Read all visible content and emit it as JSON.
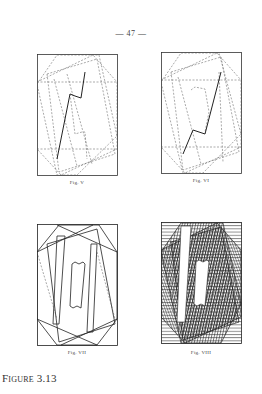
{
  "page": {
    "number": "— 47 —"
  },
  "figures": [
    {
      "id": "fig-v",
      "label": "Fig. V"
    },
    {
      "id": "fig-vi",
      "label": "Fig. VI"
    },
    {
      "id": "fig-vii",
      "label": "Fig. VII"
    },
    {
      "id": "fig-viii",
      "label": "Fig. VIII"
    }
  ],
  "caption": {
    "text": "Figure 3.13"
  },
  "colors": {
    "ink": "#333333",
    "paper": "#ffffff"
  }
}
